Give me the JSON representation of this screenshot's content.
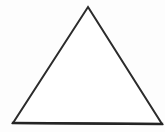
{
  "figure": {
    "title": "Triangle",
    "type": "geometric-shape",
    "shape_name": "triangle",
    "shape_variant": "isosceles-triangle",
    "canvas": {
      "width": 165,
      "height": 132,
      "background_color": "#fdfdfd"
    },
    "stroke": {
      "color": "#2b2b2b",
      "width": 2,
      "baseline_color": "#242424",
      "baseline_width": 2.4
    },
    "fill": {
      "color": "#ffffff"
    },
    "vertices": [
      {
        "name": "apex",
        "x": 88,
        "y": 7
      },
      {
        "name": "bottom-right",
        "x": 162,
        "y": 124
      },
      {
        "name": "bottom-left",
        "x": 13,
        "y": 123
      }
    ],
    "points_attr": "88,7 162,124 13,123",
    "baseline_path": "M13,123 L162,124",
    "edges": [
      {
        "name": "left-edge",
        "from": "apex",
        "to": "bottom-left"
      },
      {
        "name": "right-edge",
        "from": "apex",
        "to": "bottom-right"
      },
      {
        "name": "base-edge",
        "from": "bottom-left",
        "to": "bottom-right"
      }
    ]
  }
}
